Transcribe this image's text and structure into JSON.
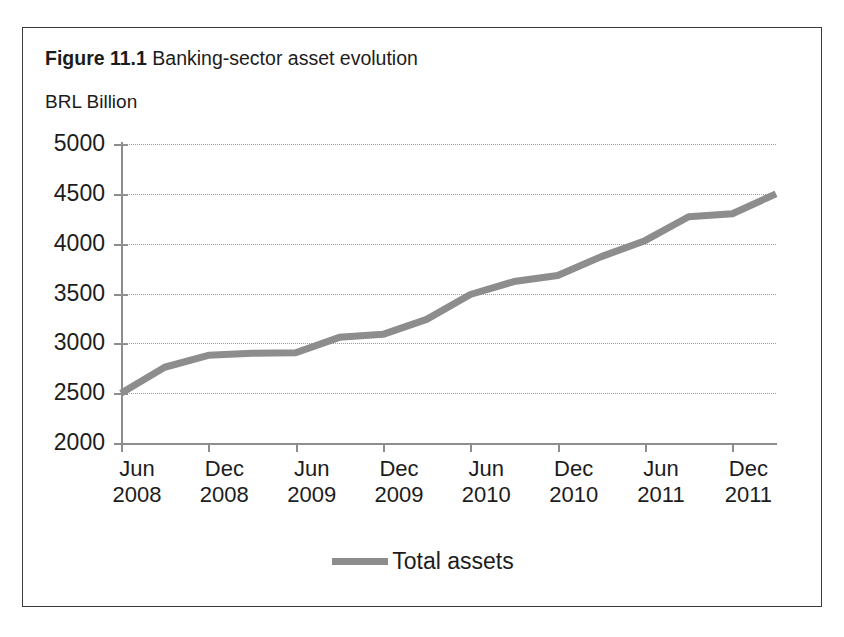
{
  "figure": {
    "caption_label": "Figure 11.1",
    "caption_text": "Banking-sector asset evolution"
  },
  "chart_data": {
    "type": "line",
    "title": "Figure 11.1 Banking-sector asset evolution",
    "subtitle": "",
    "xlabel": "",
    "ylabel": "BRL Billion",
    "unit_label": "BRL Billion",
    "grid": true,
    "legend_position": "bottom-center",
    "xlim_labels": [
      "Jun 2008",
      "Dec 2011"
    ],
    "ylim": [
      2000,
      5000
    ],
    "ytick_labels": [
      "5000",
      "4500",
      "4000",
      "3500",
      "3000",
      "2500",
      "2000"
    ],
    "yticks": [
      5000,
      4500,
      4000,
      3500,
      3000,
      2500,
      2000
    ],
    "xtick_labels": [
      {
        "month": "Jun",
        "year": "2008"
      },
      {
        "month": "Dec",
        "year": "2008"
      },
      {
        "month": "Jun",
        "year": "2009"
      },
      {
        "month": "Dec",
        "year": "2009"
      },
      {
        "month": "Jun",
        "year": "2010"
      },
      {
        "month": "Dec",
        "year": "2010"
      },
      {
        "month": "Jun",
        "year": "2011"
      },
      {
        "month": "Dec",
        "year": "2011"
      }
    ],
    "x": [
      "Jun 2008",
      "Sep 2008",
      "Dec 2008",
      "Mar 2009",
      "Jun 2009",
      "Sep 2009",
      "Dec 2009",
      "Mar 2010",
      "Jun 2010",
      "Sep 2010",
      "Dec 2010",
      "Mar 2011",
      "Jun 2011",
      "Sep 2011",
      "Dec 2011",
      "Mar 2012"
    ],
    "series": [
      {
        "name": "Total assets",
        "color": "#8d8d8d",
        "values": [
          2500,
          2760,
          2880,
          2900,
          2905,
          3060,
          3090,
          3240,
          3490,
          3620,
          3680,
          3870,
          4030,
          4270,
          4300,
          4500
        ]
      }
    ],
    "legend": [
      "Total assets"
    ],
    "annotations": []
  },
  "legend": {
    "swatch_name": "line-swatch",
    "label": "Total assets"
  }
}
